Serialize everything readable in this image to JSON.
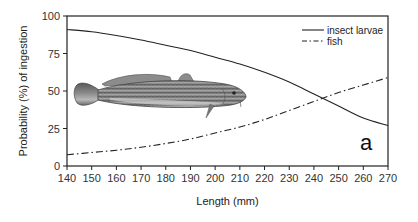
{
  "chart_data": {
    "type": "line",
    "title": "",
    "panel_label": "a",
    "xlabel": "Length (mm)",
    "ylabel": "Probability (%) of ingestion",
    "xlim": [
      140,
      270
    ],
    "ylim": [
      0,
      100
    ],
    "xticks": [
      140,
      150,
      160,
      170,
      180,
      190,
      200,
      210,
      220,
      230,
      240,
      250,
      260,
      270
    ],
    "yticks": [
      0,
      25,
      50,
      75,
      100
    ],
    "grid": false,
    "legend_position": "top-right",
    "x": [
      140,
      150,
      160,
      170,
      180,
      190,
      200,
      210,
      220,
      230,
      240,
      250,
      260,
      270
    ],
    "series": [
      {
        "name": "insect larvae",
        "style": "solid",
        "values": [
          91,
          89.5,
          87,
          84,
          80.5,
          77,
          72.5,
          68,
          62.5,
          56,
          48,
          40,
          32,
          27
        ]
      },
      {
        "name": "fish",
        "style": "dash-dot",
        "values": [
          7.5,
          9,
          10.5,
          12.5,
          15,
          18,
          22,
          26,
          31,
          37,
          43,
          49,
          54,
          59
        ]
      }
    ],
    "annotations": [
      "illustration of a burbot fish (Lota lota) in the plot area"
    ]
  },
  "legend": {
    "items": [
      {
        "label": "insect larvae",
        "style": "solid"
      },
      {
        "label": "fish",
        "style": "dash-dot"
      }
    ]
  },
  "colors": {
    "axis": "#222222",
    "line": "#222222",
    "background": "#ffffff"
  }
}
